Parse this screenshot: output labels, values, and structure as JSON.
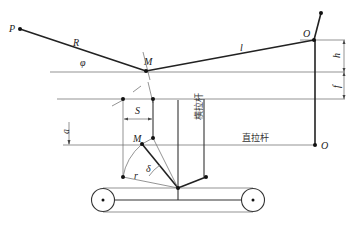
{
  "diagram": {
    "points": {
      "P": "P",
      "M_upper": "M",
      "O_upper": "O",
      "M_lower": "M",
      "O_lower": "O"
    },
    "segments": {
      "R": "R",
      "l": "l",
      "r": "r"
    },
    "angles": {
      "phi": "φ",
      "delta": "δ"
    },
    "dimensions": {
      "h": "h",
      "f": "f",
      "S": "S",
      "a": "a"
    },
    "rods": {
      "transverse_rod": "横拉杆",
      "straight_rod": "直拉杆"
    }
  }
}
